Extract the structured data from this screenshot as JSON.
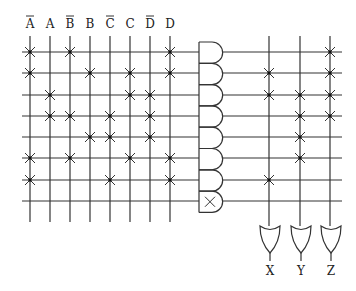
{
  "colors": {
    "line": "#333333",
    "background": "#ffffff"
  },
  "inputs": [
    {
      "label": "A",
      "bar": true,
      "x": 30
    },
    {
      "label": "A",
      "bar": false,
      "x": 50
    },
    {
      "label": "B",
      "bar": true,
      "x": 70
    },
    {
      "label": "B",
      "bar": false,
      "x": 90
    },
    {
      "label": "C",
      "bar": true,
      "x": 110
    },
    {
      "label": "C",
      "bar": false,
      "x": 130
    },
    {
      "label": "D",
      "bar": true,
      "x": 150
    },
    {
      "label": "D",
      "bar": false,
      "x": 170
    }
  ],
  "rows_y": [
    52,
    73,
    95,
    116,
    137,
    158,
    180,
    201
  ],
  "and_plane_connections": [
    [
      0,
      2,
      7
    ],
    [
      0,
      3,
      5,
      7
    ],
    [
      1,
      5,
      6
    ],
    [
      1,
      2,
      4,
      6
    ],
    [
      3,
      4,
      6
    ],
    [
      0,
      2,
      5,
      7
    ],
    [
      0,
      4,
      7
    ],
    []
  ],
  "and_gates": {
    "count": 8,
    "last_gate_marked_x": true
  },
  "outputs": [
    {
      "label": "X",
      "x": 269
    },
    {
      "label": "Y",
      "x": 300
    },
    {
      "label": "Z",
      "x": 330
    }
  ],
  "or_plane_connections": [
    [
      2
    ],
    [
      0,
      2
    ],
    [
      0,
      1,
      2
    ],
    [
      1,
      2
    ],
    [
      1
    ],
    [
      1
    ],
    [
      0
    ],
    []
  ]
}
